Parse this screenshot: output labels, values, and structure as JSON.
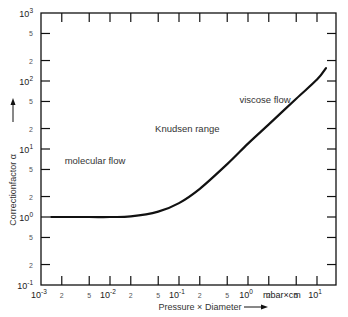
{
  "chart_data": {
    "type": "line",
    "title": "",
    "xlabel": "Pressure × Diameter",
    "xunit": "mbar×cm",
    "ylabel": "Correctionfactor α",
    "xscale": "log",
    "yscale": "log",
    "xlim": [
      0.001,
      20
    ],
    "ylim": [
      0.1,
      1000
    ],
    "grid": false,
    "legend": null,
    "x_major_ticks": [
      "10^-3",
      "10^-2",
      "10^-1",
      "10^0",
      "10^1"
    ],
    "x_minor_tick_labels": [
      "2",
      "5"
    ],
    "y_major_ticks": [
      "10^-1",
      "10^0",
      "10^1",
      "10^2",
      "10^3"
    ],
    "y_minor_tick_labels": [
      "2",
      "5"
    ],
    "series": [
      {
        "name": "Correction factor α",
        "x": [
          0.0014,
          0.005,
          0.01,
          0.02,
          0.05,
          0.1,
          0.2,
          0.5,
          1,
          2,
          5,
          10,
          13.5
        ],
        "y": [
          1.0,
          1.0,
          1.0,
          1.02,
          1.2,
          1.6,
          2.6,
          6.0,
          12,
          23,
          55,
          105,
          155
        ]
      }
    ],
    "annotations": [
      {
        "text": "molecular flow",
        "x": 0.0022,
        "y": 6
      },
      {
        "text": "Knudsen range",
        "x": 0.045,
        "y": 18
      },
      {
        "text": "viscose flow",
        "x": 0.75,
        "y": 48
      }
    ]
  }
}
